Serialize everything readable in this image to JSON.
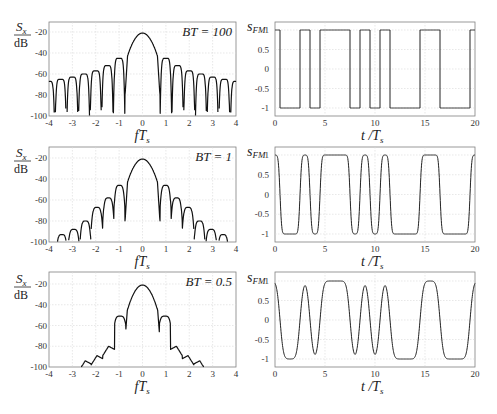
{
  "chart_data": [
    {
      "type": "line",
      "title": "PSD BT = 100",
      "annotation": "BT = 100",
      "xlabel": "fT_s",
      "ylabel": "S_x / dB",
      "xlim": [
        -4,
        4
      ],
      "ylim": [
        -100,
        -10
      ],
      "xticks": [
        -4,
        -3,
        -2,
        -1,
        0,
        1,
        2,
        3,
        4
      ],
      "yticks": [
        -20,
        -40,
        -60,
        -80,
        -100
      ],
      "grid": true,
      "main_lobe_peak_db": -21,
      "sidelobe_peaks_db": [
        -45,
        -52,
        -57,
        -60,
        -63,
        -65,
        -67,
        -69
      ],
      "bt": 100
    },
    {
      "type": "line",
      "title": "s_FM BT = 100",
      "xlabel": "t / T_s",
      "ylabel": "s_FM",
      "xlim": [
        0,
        20
      ],
      "ylim": [
        -1.2,
        1.2
      ],
      "xticks": [
        0,
        5,
        10,
        15,
        20
      ],
      "yticks": [
        1,
        0.5,
        0,
        -0.5,
        -1
      ],
      "grid": true,
      "symbols": [
        1,
        -1,
        -1,
        1,
        -1,
        1,
        1,
        1,
        -1,
        1,
        -1,
        1,
        -1,
        -1,
        -1,
        1,
        1,
        -1,
        -1,
        -1,
        1
      ],
      "bt": 100
    },
    {
      "type": "line",
      "title": "PSD BT = 1",
      "annotation": "BT = 1",
      "xlabel": "fT_s",
      "ylabel": "S_x / dB",
      "xlim": [
        -4,
        4
      ],
      "ylim": [
        -100,
        -10
      ],
      "xticks": [
        -4,
        -3,
        -2,
        -1,
        0,
        1,
        2,
        3,
        4
      ],
      "yticks": [
        -20,
        -40,
        -60,
        -80,
        -100
      ],
      "grid": true,
      "main_lobe_peak_db": -21,
      "sidelobe_peaks_db": [
        -46,
        -58,
        -67,
        -80,
        -88
      ],
      "bt": 1
    },
    {
      "type": "line",
      "title": "s_FM BT = 1",
      "xlabel": "t / T_s",
      "ylabel": "s_FM",
      "xlim": [
        0,
        20
      ],
      "ylim": [
        -1.2,
        1.2
      ],
      "xticks": [
        0,
        5,
        10,
        15,
        20
      ],
      "yticks": [
        1,
        0.5,
        0,
        -0.5,
        -1
      ],
      "grid": true,
      "symbols": [
        1,
        -1,
        -1,
        1,
        -1,
        1,
        1,
        1,
        -1,
        1,
        -1,
        1,
        -1,
        -1,
        -1,
        1,
        1,
        -1,
        -1,
        -1,
        1
      ],
      "bt": 1
    },
    {
      "type": "line",
      "title": "PSD BT = 0.5",
      "annotation": "BT = 0.5",
      "xlabel": "fT_s",
      "ylabel": "S_x / dB",
      "xlim": [
        -4,
        4
      ],
      "ylim": [
        -100,
        -10
      ],
      "xticks": [
        -4,
        -3,
        -2,
        -1,
        0,
        1,
        2,
        3,
        4
      ],
      "yticks": [
        -20,
        -40,
        -60,
        -80,
        -100
      ],
      "grid": true,
      "main_lobe_peak_db": -21,
      "sidelobe_peaks_db": [
        -51,
        -77,
        -86
      ],
      "bt": 0.5
    },
    {
      "type": "line",
      "title": "s_FM BT = 0.5",
      "xlabel": "t / T_s",
      "ylabel": "s_FM",
      "xlim": [
        0,
        20
      ],
      "ylim": [
        -1.2,
        1.2
      ],
      "xticks": [
        0,
        5,
        10,
        15,
        20
      ],
      "yticks": [
        1,
        0.5,
        0,
        -0.5,
        -1
      ],
      "grid": true,
      "symbols": [
        1,
        -1,
        -1,
        1,
        -1,
        1,
        1,
        1,
        -1,
        1,
        -1,
        1,
        -1,
        -1,
        -1,
        1,
        1,
        -1,
        -1,
        -1,
        1
      ],
      "bt": 0.5
    }
  ],
  "labels": {
    "psd_ylabel_num": "S",
    "psd_ylabel_sub": "x",
    "psd_ylabel_den": "dB",
    "psd_xlabel": "fT",
    "psd_xlabel_sub": "s",
    "sig_ylabel": "s",
    "sig_ylabel_sub": "FM",
    "sig_xlabel": "t /T",
    "sig_xlabel_sub": "s",
    "bt_annotations": [
      "BT = 100",
      "BT = 1",
      "BT = 0.5"
    ]
  }
}
